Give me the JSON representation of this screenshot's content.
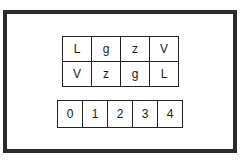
{
  "letter_grid": {
    "rows": [
      [
        "L",
        "g",
        "z",
        "V"
      ],
      [
        "V",
        "z",
        "g",
        "L"
      ]
    ]
  },
  "number_row": {
    "cells": [
      "0",
      "1",
      "2",
      "3",
      "4"
    ]
  },
  "colors": {
    "frame": "#2b2b2b",
    "cell_border": "#222222",
    "text": "#1a1a1a",
    "background": "#ffffff"
  }
}
